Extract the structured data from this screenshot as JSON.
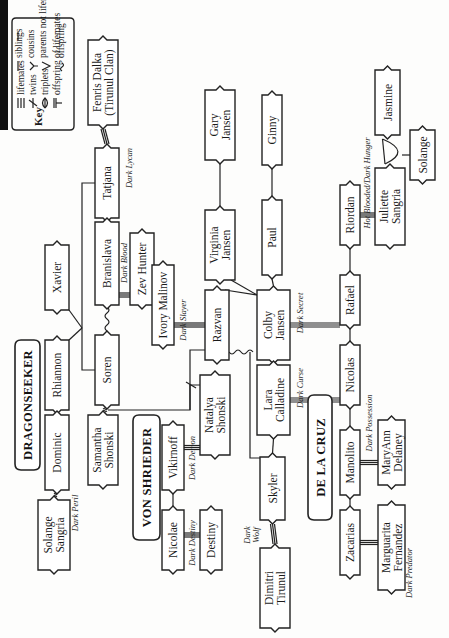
{
  "key": {
    "title": "Key",
    "entries": [
      {
        "symbol": "lifemates",
        "label": "lifemates"
      },
      {
        "symbol": "twins",
        "label": "twins"
      },
      {
        "symbol": "triplets",
        "label": "triplets"
      },
      {
        "symbol": "offspring-of-lifemates",
        "label": "offspring of lifemates"
      },
      {
        "symbol": "siblings",
        "label": "siblings"
      },
      {
        "symbol": "cousins",
        "label": "cousins"
      },
      {
        "symbol": "parents-not-lifemates",
        "label": "parents not lifemates"
      },
      {
        "symbol": "offspring",
        "label": "offspring"
      }
    ]
  },
  "families": {
    "dragonseeker": "DRAGONSEEKER",
    "von_shrieder": "VON SHRIEDER",
    "de_la_cruz": "DE LA CRUZ"
  },
  "people": {
    "fenris": [
      "Fenris Dalka",
      "(Tirunul Clan)"
    ],
    "tatjana": [
      "Tatjana"
    ],
    "branislava": [
      "Branislava"
    ],
    "zev": [
      "Zev Hunter"
    ],
    "soren": [
      "Soren"
    ],
    "xavier": [
      "Xavier"
    ],
    "rhiannon": [
      "Rhiannon"
    ],
    "dominic": [
      "Dominic"
    ],
    "solange_sangria": [
      "Solange",
      "Sangria"
    ],
    "samantha": [
      "Samantha",
      "Shonski"
    ],
    "vikirnoff": [
      "Vikirnoff"
    ],
    "natalya": [
      "Natalya",
      "Shonski"
    ],
    "nicolae": [
      "Nicolae"
    ],
    "destiny": [
      "Destiny"
    ],
    "ivory": [
      "Ivory Malinov"
    ],
    "razvan": [
      "Razvan"
    ],
    "virginia": [
      "Virginia",
      "Jansen"
    ],
    "gary": [
      "Gary",
      "Jansen"
    ],
    "paul": [
      "Paul"
    ],
    "ginny": [
      "Ginny"
    ],
    "colby": [
      "Colby",
      "Jansen"
    ],
    "lara": [
      "Lara",
      "Calladine"
    ],
    "skyler": [
      "Skyler"
    ],
    "dimitri": [
      "Dimitri",
      "Tirunul"
    ],
    "rafael": [
      "Rafael"
    ],
    "riordan": [
      "Riordan"
    ],
    "juliette": [
      "Juliette",
      "Sangria"
    ],
    "jasmine": [
      "Jasmine"
    ],
    "solange": [
      "Solange"
    ],
    "nicolas": [
      "Nicolas"
    ],
    "manolito": [
      "Manolito"
    ],
    "maryann": [
      "MaryAnn",
      "Delaney"
    ],
    "zacarias": [
      "Zacarias"
    ],
    "marguarita": [
      "Marguarita",
      "Fernandez"
    ]
  },
  "books": {
    "dark_lycan": "Dark Lycan",
    "dark_blood": "Dark Blood",
    "dark_peril": "Dark Peril",
    "dark_demon": "Dark Demon",
    "dark_destiny": "Dark Destiny",
    "dark_slayer": "Dark Slayer",
    "dark_secret": "Dark Secret",
    "dark_curse": "Dark Curse",
    "dark_wolf_1": "Dark",
    "dark_wolf_2": "Wolf",
    "hot_blooded": "Hot Blooded/Dark Hunger",
    "dark_possession": "Dark Possession",
    "dark_predator": "Dark Predator"
  }
}
